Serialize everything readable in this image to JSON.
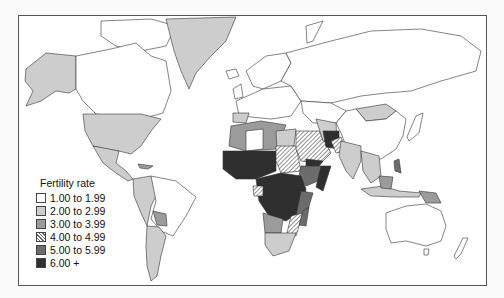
{
  "map": {
    "title": "Fertility rate world map",
    "legend": {
      "title": "Fertility rate",
      "items": [
        {
          "label": "1.00 to 1.99",
          "fill": "#ffffff",
          "pattern": false
        },
        {
          "label": "2.00 to 2.99",
          "fill": "#cdcdcd",
          "pattern": false
        },
        {
          "label": "3.00 to 3.99",
          "fill": "#9b9b9b",
          "pattern": false
        },
        {
          "label": "4.00 to 4.99",
          "fill": "url(#hatch)",
          "pattern": true
        },
        {
          "label": "5.00 to 5.99",
          "fill": "#6c6c6c",
          "pattern": false
        },
        {
          "label": "6.00 +",
          "fill": "#2f2f2f",
          "pattern": false
        }
      ]
    },
    "regions": [
      {
        "name": "Alaska (USA)",
        "class": "2.00 to 2.99"
      },
      {
        "name": "Canada",
        "class": "1.00 to 1.99"
      },
      {
        "name": "Greenland",
        "class": "2.00 to 2.99"
      },
      {
        "name": "United States",
        "class": "2.00 to 2.99"
      },
      {
        "name": "Mexico & Central America",
        "class": "2.00 to 2.99"
      },
      {
        "name": "South America (north-west)",
        "class": "2.00 to 2.99"
      },
      {
        "name": "Brazil",
        "class": "1.00 to 1.99"
      },
      {
        "name": "Argentina",
        "class": "2.00 to 2.99"
      },
      {
        "name": "Europe",
        "class": "1.00 to 1.99"
      },
      {
        "name": "Russia",
        "class": "1.00 to 1.99"
      },
      {
        "name": "North Africa",
        "class": "3.00 to 3.99"
      },
      {
        "name": "Sahel / West Africa",
        "class": "6.00 +"
      },
      {
        "name": "Sudan",
        "class": "4.00 to 4.99"
      },
      {
        "name": "Central Africa",
        "class": "6.00 +"
      },
      {
        "name": "East Africa",
        "class": "5.00 to 5.99"
      },
      {
        "name": "Southern Africa",
        "class": "2.00 to 2.99"
      },
      {
        "name": "Madagascar",
        "class": "5.00 to 5.99"
      },
      {
        "name": "Arabian Peninsula",
        "class": "4.00 to 4.99"
      },
      {
        "name": "Afghanistan",
        "class": "6.00 +"
      },
      {
        "name": "Pakistan",
        "class": "4.00 to 4.99"
      },
      {
        "name": "India",
        "class": "2.00 to 2.99"
      },
      {
        "name": "Mongolia",
        "class": "2.00 to 2.99"
      },
      {
        "name": "China",
        "class": "1.00 to 1.99"
      },
      {
        "name": "Southeast Asia",
        "class": "2.00 to 2.99"
      },
      {
        "name": "Papua New Guinea",
        "class": "3.00 to 3.99"
      },
      {
        "name": "Australia",
        "class": "1.00 to 1.99"
      },
      {
        "name": "New Zealand",
        "class": "1.00 to 1.99"
      }
    ]
  }
}
